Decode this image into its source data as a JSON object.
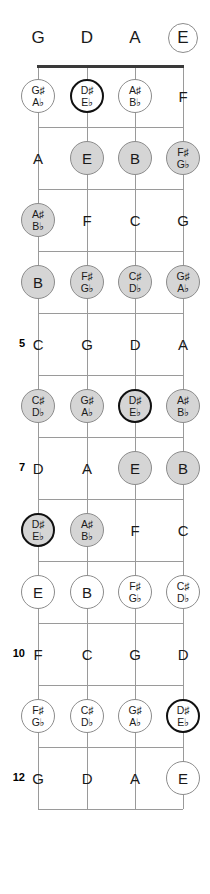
{
  "diagram": {
    "instrument_tuning": [
      "G",
      "D",
      "A",
      "E"
    ],
    "string_count": 4,
    "fret_count": 12,
    "highlighted_note": "D#/Eb"
  },
  "geometry": {
    "string_x": [
      38,
      87,
      135,
      183
    ],
    "nut_y": 65,
    "fret_spacing": 62,
    "first_fret_y": 127
  },
  "legend": {
    "styles": [
      "plain",
      "gray",
      "open",
      "hilite",
      "hiliteopen"
    ]
  },
  "open_strings": [
    {
      "label": "G",
      "style": "plain"
    },
    {
      "label": "D",
      "style": "plain"
    },
    {
      "label": "A",
      "style": "plain"
    },
    {
      "label": "E",
      "style": "ring"
    }
  ],
  "fret_numbers": [
    {
      "fret": 5,
      "label": "5"
    },
    {
      "fret": 7,
      "label": "7"
    },
    {
      "fret": 10,
      "label": "10"
    },
    {
      "fret": 12,
      "label": "12"
    }
  ],
  "frets": [
    {
      "fret": 1,
      "notes": [
        {
          "sharp": "G♯",
          "flat": "A♭",
          "style": "open",
          "accidental": true
        },
        {
          "sharp": "D♯",
          "flat": "E♭",
          "style": "hiliteopen",
          "accidental": true
        },
        {
          "sharp": "A♯",
          "flat": "B♭",
          "style": "open",
          "accidental": true
        },
        {
          "sharp": "F",
          "flat": "",
          "style": "plain",
          "accidental": false
        }
      ]
    },
    {
      "fret": 2,
      "notes": [
        {
          "sharp": "A",
          "flat": "",
          "style": "plain",
          "accidental": false
        },
        {
          "sharp": "E",
          "flat": "",
          "style": "gray",
          "accidental": false
        },
        {
          "sharp": "B",
          "flat": "",
          "style": "gray",
          "accidental": false
        },
        {
          "sharp": "F♯",
          "flat": "G♭",
          "style": "gray",
          "accidental": true
        }
      ]
    },
    {
      "fret": 3,
      "notes": [
        {
          "sharp": "A♯",
          "flat": "B♭",
          "style": "gray",
          "accidental": true
        },
        {
          "sharp": "F",
          "flat": "",
          "style": "plain",
          "accidental": false
        },
        {
          "sharp": "C",
          "flat": "",
          "style": "plain",
          "accidental": false
        },
        {
          "sharp": "G",
          "flat": "",
          "style": "plain",
          "accidental": false
        }
      ]
    },
    {
      "fret": 4,
      "notes": [
        {
          "sharp": "B",
          "flat": "",
          "style": "gray",
          "accidental": false
        },
        {
          "sharp": "F♯",
          "flat": "G♭",
          "style": "gray",
          "accidental": true
        },
        {
          "sharp": "C♯",
          "flat": "D♭",
          "style": "gray",
          "accidental": true
        },
        {
          "sharp": "G♯",
          "flat": "A♭",
          "style": "gray",
          "accidental": true
        }
      ]
    },
    {
      "fret": 5,
      "notes": [
        {
          "sharp": "C",
          "flat": "",
          "style": "plain",
          "accidental": false
        },
        {
          "sharp": "G",
          "flat": "",
          "style": "plain",
          "accidental": false
        },
        {
          "sharp": "D",
          "flat": "",
          "style": "plain",
          "accidental": false
        },
        {
          "sharp": "A",
          "flat": "",
          "style": "plain",
          "accidental": false
        }
      ]
    },
    {
      "fret": 6,
      "notes": [
        {
          "sharp": "C♯",
          "flat": "D♭",
          "style": "gray",
          "accidental": true
        },
        {
          "sharp": "G♯",
          "flat": "A♭",
          "style": "gray",
          "accidental": true
        },
        {
          "sharp": "D♯",
          "flat": "E♭",
          "style": "hilite",
          "accidental": true
        },
        {
          "sharp": "A♯",
          "flat": "B♭",
          "style": "gray",
          "accidental": true
        }
      ]
    },
    {
      "fret": 7,
      "notes": [
        {
          "sharp": "D",
          "flat": "",
          "style": "plain",
          "accidental": false
        },
        {
          "sharp": "A",
          "flat": "",
          "style": "plain",
          "accidental": false
        },
        {
          "sharp": "E",
          "flat": "",
          "style": "gray",
          "accidental": false
        },
        {
          "sharp": "B",
          "flat": "",
          "style": "gray",
          "accidental": false
        }
      ]
    },
    {
      "fret": 8,
      "notes": [
        {
          "sharp": "D♯",
          "flat": "E♭",
          "style": "hilite",
          "accidental": true
        },
        {
          "sharp": "A♯",
          "flat": "B♭",
          "style": "gray",
          "accidental": true
        },
        {
          "sharp": "F",
          "flat": "",
          "style": "plain",
          "accidental": false
        },
        {
          "sharp": "C",
          "flat": "",
          "style": "plain",
          "accidental": false
        }
      ]
    },
    {
      "fret": 9,
      "notes": [
        {
          "sharp": "E",
          "flat": "",
          "style": "open",
          "accidental": false
        },
        {
          "sharp": "B",
          "flat": "",
          "style": "open",
          "accidental": false
        },
        {
          "sharp": "F♯",
          "flat": "G♭",
          "style": "open",
          "accidental": true
        },
        {
          "sharp": "C♯",
          "flat": "D♭",
          "style": "open",
          "accidental": true
        }
      ]
    },
    {
      "fret": 10,
      "notes": [
        {
          "sharp": "F",
          "flat": "",
          "style": "plain",
          "accidental": false
        },
        {
          "sharp": "C",
          "flat": "",
          "style": "plain",
          "accidental": false
        },
        {
          "sharp": "G",
          "flat": "",
          "style": "plain",
          "accidental": false
        },
        {
          "sharp": "D",
          "flat": "",
          "style": "plain",
          "accidental": false
        }
      ]
    },
    {
      "fret": 11,
      "notes": [
        {
          "sharp": "F♯",
          "flat": "G♭",
          "style": "open",
          "accidental": true
        },
        {
          "sharp": "C♯",
          "flat": "D♭",
          "style": "open",
          "accidental": true
        },
        {
          "sharp": "G♯",
          "flat": "A♭",
          "style": "open",
          "accidental": true
        },
        {
          "sharp": "D♯",
          "flat": "E♭",
          "style": "hiliteopen",
          "accidental": true
        }
      ]
    },
    {
      "fret": 12,
      "notes": [
        {
          "sharp": "G",
          "flat": "",
          "style": "plain",
          "accidental": false
        },
        {
          "sharp": "D",
          "flat": "",
          "style": "plain",
          "accidental": false
        },
        {
          "sharp": "A",
          "flat": "",
          "style": "plain",
          "accidental": false
        },
        {
          "sharp": "E",
          "flat": "",
          "style": "open",
          "accidental": false
        }
      ]
    }
  ]
}
